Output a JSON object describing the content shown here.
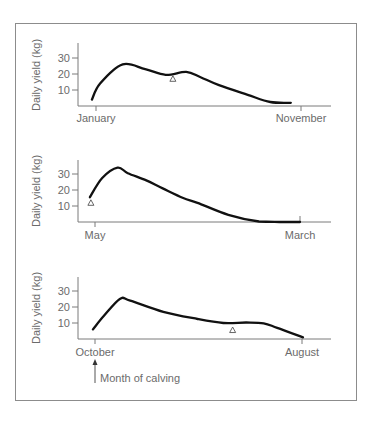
{
  "figure": {
    "annotation": "Month of calving"
  },
  "chart_data": [
    {
      "type": "line",
      "title": "",
      "xlabel": "",
      "ylabel": "Daily yield (kg)",
      "y_ticks": [
        "30",
        "20",
        "10"
      ],
      "x_tick_labels": [
        "January",
        "November"
      ],
      "x_span_months": 10,
      "grid": false,
      "series": [
        {
          "name": "Calving in January",
          "points_month_offset_vs_kg": [
            [
              -0.2,
              4
            ],
            [
              0.2,
              14
            ],
            [
              1.3,
              26
            ],
            [
              2.4,
              23
            ],
            [
              3.4,
              19.5
            ],
            [
              4.4,
              21.3
            ],
            [
              5.1,
              18
            ],
            [
              6.0,
              13
            ],
            [
              7.4,
              7
            ],
            [
              8.5,
              2.5
            ],
            [
              9.5,
              2
            ]
          ]
        }
      ],
      "markers": [
        {
          "shape": "triangle",
          "month_offset": 3.75,
          "value": 17
        }
      ]
    },
    {
      "type": "line",
      "title": "",
      "xlabel": "",
      "ylabel": "Daily yield (kg)",
      "y_ticks": [
        "30",
        "20",
        "10"
      ],
      "x_tick_labels": [
        "May",
        "March"
      ],
      "x_span_months": 10,
      "grid": false,
      "series": [
        {
          "name": "Calving in May",
          "points_month_offset_vs_kg": [
            [
              -0.25,
              15.5
            ],
            [
              0.35,
              27.5
            ],
            [
              1.1,
              34
            ],
            [
              1.6,
              30.5
            ],
            [
              2.5,
              26
            ],
            [
              3.3,
              21
            ],
            [
              4.3,
              15
            ],
            [
              5.0,
              12
            ],
            [
              6.5,
              4.5
            ],
            [
              8.0,
              0.3
            ],
            [
              9.0,
              0
            ],
            [
              10.0,
              0
            ]
          ]
        }
      ],
      "markers": [
        {
          "shape": "triangle",
          "month_offset": -0.2,
          "value": 12
        }
      ]
    },
    {
      "type": "line",
      "title": "",
      "xlabel": "",
      "ylabel": "Daily yield (kg)",
      "y_ticks": [
        "30",
        "20",
        "10"
      ],
      "x_tick_labels": [
        "October",
        "August"
      ],
      "x_span_months": 10,
      "grid": false,
      "series": [
        {
          "name": "Calving in October",
          "points_month_offset_vs_kg": [
            [
              -0.1,
              6
            ],
            [
              0.4,
              14
            ],
            [
              1.2,
              25
            ],
            [
              1.7,
              24
            ],
            [
              3.3,
              17
            ],
            [
              4.95,
              12.5
            ],
            [
              6.2,
              10
            ],
            [
              7.3,
              10.3
            ],
            [
              8.15,
              9.8
            ],
            [
              8.8,
              7
            ],
            [
              10.05,
              1
            ]
          ]
        }
      ],
      "markers": [
        {
          "shape": "triangle",
          "month_offset": 6.65,
          "value": 5.6
        }
      ]
    }
  ]
}
